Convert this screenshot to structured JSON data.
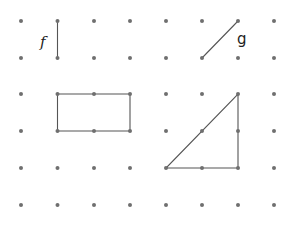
{
  "grid": {
    "columns": 8,
    "rows": 6,
    "x": [
      21,
      57.5,
      94,
      130,
      166,
      202,
      238,
      274
    ],
    "y": [
      21,
      58,
      94,
      131,
      168,
      205
    ],
    "dot_color": "#6f6f6f",
    "dot_radius": 2
  },
  "segments": {
    "f": {
      "label": "f",
      "from": [
        1,
        0
      ],
      "to": [
        1,
        1
      ]
    },
    "g": {
      "label": "g",
      "from": [
        5,
        1
      ],
      "to": [
        6,
        0
      ]
    }
  },
  "labels": {
    "f": "f",
    "g": "g"
  },
  "shapes": {
    "rectangle": {
      "corners": [
        [
          1,
          2
        ],
        [
          3,
          2
        ],
        [
          3,
          3
        ],
        [
          1,
          3
        ]
      ]
    },
    "triangle": {
      "corners": [
        [
          4,
          4
        ],
        [
          6,
          4
        ],
        [
          6,
          2
        ]
      ]
    }
  },
  "line_color": "#555555"
}
